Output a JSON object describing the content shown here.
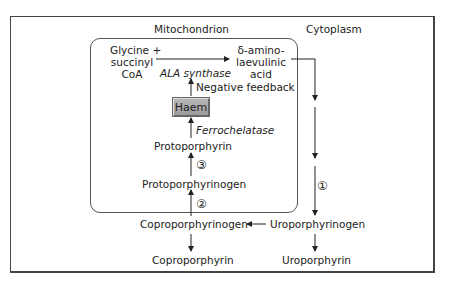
{
  "compartments": {
    "mitochondrion": "Mitochondrion",
    "cytoplasm": "Cytoplasm"
  },
  "nodes": {
    "glycine_line1": "Glycine +",
    "glycine_line2": "succinyl",
    "glycine_line3": "CoA",
    "ala_line1": "δ-amino-",
    "ala_line2": "laevulinic",
    "ala_line3": "acid",
    "haem": "Haem",
    "protoporphyrin": "Protoporphyrin",
    "protoporphyrinogen": "Protoporphyrinogen",
    "coproporphyrinogen": "Coproporphyrinogen",
    "coproporphyrin": "Coproporphyrin",
    "uroporphyrinogen": "Uroporphyrinogen",
    "uroporphyrin": "Uroporphyrin"
  },
  "enzymes": {
    "ala_synthase": "ALA synthase",
    "ferrochelatase": "Ferrochelatase"
  },
  "annotations": {
    "negative_feedback": "Negative feedback",
    "step1": "①",
    "step2": "②",
    "step3": "③"
  }
}
